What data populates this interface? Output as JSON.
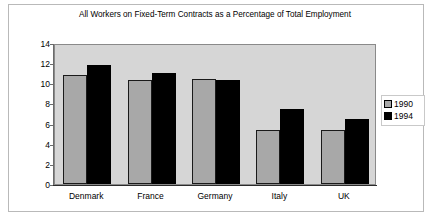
{
  "chart_data": {
    "type": "bar",
    "title": "All Workers on Fixed-Term Contracts as a Percentage of Total Employment",
    "xlabel": "",
    "ylabel": "",
    "categories": [
      "Denmark",
      "France",
      "Germany",
      "Italy",
      "UK"
    ],
    "series": [
      {
        "name": "1990",
        "values": [
          10.8,
          10.3,
          10.4,
          5.4,
          5.4
        ],
        "color": "#a8a8a8"
      },
      {
        "name": "1994",
        "values": [
          11.8,
          11.0,
          10.3,
          7.4,
          6.5
        ],
        "color": "#000000"
      }
    ],
    "ylim": [
      0,
      14
    ],
    "ytick_labels": [
      "0",
      "2",
      "4",
      "6",
      "8",
      "10",
      "12",
      "14"
    ],
    "ytick_values": [
      0,
      2,
      4,
      6,
      8,
      10,
      12,
      14
    ],
    "grid": false,
    "legend_position": "right",
    "plot_background": "#d6d6d6",
    "frame_background": "#ffffff"
  },
  "legend": {
    "entries": [
      {
        "label": "1990"
      },
      {
        "label": "1994"
      }
    ]
  }
}
